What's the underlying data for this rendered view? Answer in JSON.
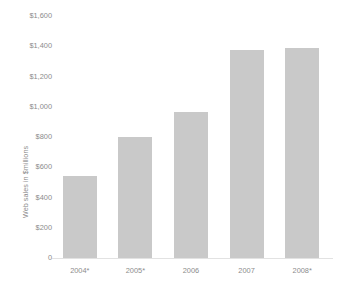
{
  "chart_data": {
    "type": "bar",
    "title": "",
    "subtitle": "",
    "xlabel": "",
    "ylabel": "Web sales in $millions",
    "categories": [
      "2004*",
      "2005*",
      "2006",
      "2007",
      "2008*"
    ],
    "values": [
      545,
      800,
      965,
      1375,
      1390
    ],
    "series": [
      {
        "name": "Web sales",
        "values": [
          545,
          800,
          965,
          1375,
          1390
        ]
      }
    ],
    "ylim": [
      0,
      1600
    ],
    "ytick_values": [
      1600,
      1400,
      1200,
      1000,
      800,
      600,
      400,
      200,
      0
    ],
    "ytick_labels": [
      "$1,600",
      "$1,400",
      "$1,200",
      "$1,000",
      "$800",
      "$600",
      "$400",
      "$200",
      "0"
    ],
    "grid": false,
    "legend": false,
    "legend_position": "none",
    "annotations": [],
    "bar_color": "#c9c9c9",
    "axis_color": "#e2e2e2",
    "text_color": "#8c8c8c",
    "background_color": "#ffffff"
  }
}
